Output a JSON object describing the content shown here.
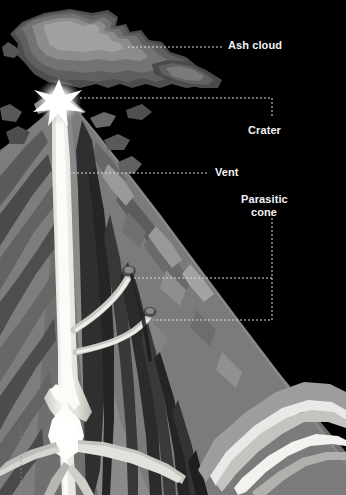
{
  "diagram": {
    "background_color": "#000000",
    "label_color": "#f2f2f2",
    "leader_color": "#d8d8d8",
    "labels": [
      {
        "id": "ash-cloud",
        "text": "Ash cloud",
        "x": 228,
        "y": 39,
        "align": "left"
      },
      {
        "id": "crater",
        "text": "Crater",
        "x": 248,
        "y": 124,
        "align": "left"
      },
      {
        "id": "vent",
        "text": "Vent",
        "x": 215,
        "y": 166,
        "align": "left"
      },
      {
        "id": "parasitic-cone",
        "text": "Parasitic",
        "x": 241,
        "y": 193,
        "align": "left"
      },
      {
        "id": "parasitic-cone-2",
        "text": "cone",
        "x": 251,
        "y": 206,
        "align": "left"
      }
    ],
    "palette": {
      "sky": "#000000",
      "cloud_dark": "#4a4a4a",
      "cloud_mid": "#5e5e5e",
      "cloud_light": "#777777",
      "cloud_pale": "#8d8d8d",
      "cone_darkest": "#2a2a2a",
      "cone_dark": "#3c3c3c",
      "cone_mid": "#5a5a5a",
      "cone_light": "#787878",
      "cone_pale": "#949494",
      "cone_palest": "#a8a8a8",
      "magma_bright": "#f5f5f0",
      "magma_mid": "#d7d7cf",
      "magma_dim": "#b5b5ad",
      "flash_core": "#ffffff"
    },
    "features": [
      {
        "name": "ash-cloud",
        "description": "mushroom shaped eruption plume above summit"
      },
      {
        "name": "crater",
        "description": "summit opening with eruption flash"
      },
      {
        "name": "vent",
        "description": "vertical central magma conduit"
      },
      {
        "name": "parasitic-cone",
        "description": "secondary side conduits on right flank"
      },
      {
        "name": "magma-chamber",
        "description": "branching magma feeder at base"
      },
      {
        "name": "strata",
        "description": "layered lava and ash beds of the cone"
      },
      {
        "name": "sill",
        "description": "bright intrusive sheets in lower right"
      }
    ]
  }
}
